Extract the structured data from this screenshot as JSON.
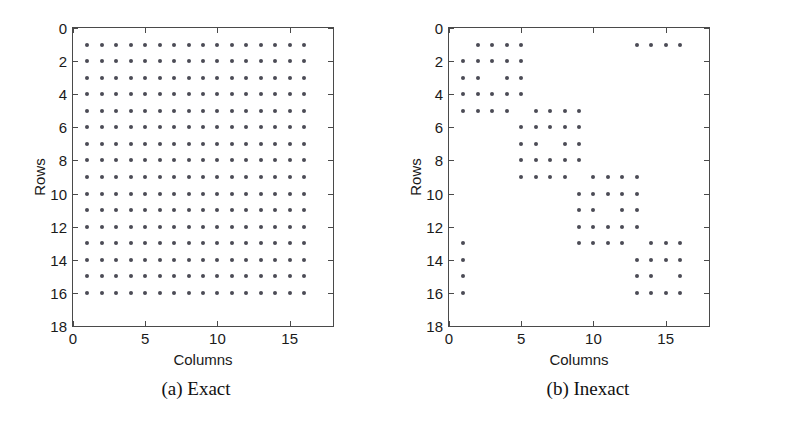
{
  "figure": {
    "background": "#ffffff",
    "dot_color": "#4b4b55",
    "axis_color": "#4a4a4a"
  },
  "panels": [
    {
      "id": "exact",
      "caption": "(a) Exact",
      "xlabel": "Columns",
      "ylabel": "Rows",
      "xticks": [
        "0",
        "5",
        "10",
        "15"
      ],
      "xtick_values": [
        0,
        5,
        10,
        15
      ],
      "yticks": [
        "0",
        "2",
        "4",
        "6",
        "8",
        "10",
        "12",
        "14",
        "16",
        "18"
      ],
      "ytick_values": [
        0,
        2,
        4,
        6,
        8,
        10,
        12,
        14,
        16,
        18
      ]
    },
    {
      "id": "inexact",
      "caption": "(b) Inexact",
      "xlabel": "Columns",
      "ylabel": "Rows",
      "xticks": [
        "0",
        "5",
        "10",
        "15"
      ],
      "xtick_values": [
        0,
        5,
        10,
        15
      ],
      "yticks": [
        "0",
        "2",
        "4",
        "6",
        "8",
        "10",
        "12",
        "14",
        "16",
        "18"
      ],
      "ytick_values": [
        0,
        2,
        4,
        6,
        8,
        10,
        12,
        14,
        16,
        18
      ]
    }
  ],
  "chart_data": [
    {
      "type": "scatter",
      "title": "(a) Exact",
      "xlabel": "Columns",
      "ylabel": "Rows",
      "xlim": [
        0,
        18
      ],
      "ylim": [
        18,
        0
      ],
      "y_inverted": true,
      "grid": false,
      "legend": null,
      "marker": "dot",
      "description": "Dense sparsity pattern: every entry of a 16x16 matrix is nonzero.",
      "points": [
        {
          "col": 1,
          "rows": [
            1,
            2,
            3,
            4,
            5,
            6,
            7,
            8,
            9,
            10,
            11,
            12,
            13,
            14,
            15,
            16
          ]
        },
        {
          "col": 2,
          "rows": [
            1,
            2,
            3,
            4,
            5,
            6,
            7,
            8,
            9,
            10,
            11,
            12,
            13,
            14,
            15,
            16
          ]
        },
        {
          "col": 3,
          "rows": [
            1,
            2,
            3,
            4,
            5,
            6,
            7,
            8,
            9,
            10,
            11,
            12,
            13,
            14,
            15,
            16
          ]
        },
        {
          "col": 4,
          "rows": [
            1,
            2,
            3,
            4,
            5,
            6,
            7,
            8,
            9,
            10,
            11,
            12,
            13,
            14,
            15,
            16
          ]
        },
        {
          "col": 5,
          "rows": [
            1,
            2,
            3,
            4,
            5,
            6,
            7,
            8,
            9,
            10,
            11,
            12,
            13,
            14,
            15,
            16
          ]
        },
        {
          "col": 6,
          "rows": [
            1,
            2,
            3,
            4,
            5,
            6,
            7,
            8,
            9,
            10,
            11,
            12,
            13,
            14,
            15,
            16
          ]
        },
        {
          "col": 7,
          "rows": [
            1,
            2,
            3,
            4,
            5,
            6,
            7,
            8,
            9,
            10,
            11,
            12,
            13,
            14,
            15,
            16
          ]
        },
        {
          "col": 8,
          "rows": [
            1,
            2,
            3,
            4,
            5,
            6,
            7,
            8,
            9,
            10,
            11,
            12,
            13,
            14,
            15,
            16
          ]
        },
        {
          "col": 9,
          "rows": [
            1,
            2,
            3,
            4,
            5,
            6,
            7,
            8,
            9,
            10,
            11,
            12,
            13,
            14,
            15,
            16
          ]
        },
        {
          "col": 10,
          "rows": [
            1,
            2,
            3,
            4,
            5,
            6,
            7,
            8,
            9,
            10,
            11,
            12,
            13,
            14,
            15,
            16
          ]
        },
        {
          "col": 11,
          "rows": [
            1,
            2,
            3,
            4,
            5,
            6,
            7,
            8,
            9,
            10,
            11,
            12,
            13,
            14,
            15,
            16
          ]
        },
        {
          "col": 12,
          "rows": [
            1,
            2,
            3,
            4,
            5,
            6,
            7,
            8,
            9,
            10,
            11,
            12,
            13,
            14,
            15,
            16
          ]
        },
        {
          "col": 13,
          "rows": [
            1,
            2,
            3,
            4,
            5,
            6,
            7,
            8,
            9,
            10,
            11,
            12,
            13,
            14,
            15,
            16
          ]
        },
        {
          "col": 14,
          "rows": [
            1,
            2,
            3,
            4,
            5,
            6,
            7,
            8,
            9,
            10,
            11,
            12,
            13,
            14,
            15,
            16
          ]
        },
        {
          "col": 15,
          "rows": [
            1,
            2,
            3,
            4,
            5,
            6,
            7,
            8,
            9,
            10,
            11,
            12,
            13,
            14,
            15,
            16
          ]
        },
        {
          "col": 16,
          "rows": [
            1,
            2,
            3,
            4,
            5,
            6,
            7,
            8,
            9,
            10,
            11,
            12,
            13,
            14,
            15,
            16
          ]
        }
      ],
      "nonzero_count": 256
    },
    {
      "type": "scatter",
      "title": "(b) Inexact",
      "xlabel": "Columns",
      "ylabel": "Rows",
      "xlim": [
        0,
        18
      ],
      "ylim": [
        18,
        0
      ],
      "y_inverted": true,
      "grid": false,
      "legend": null,
      "marker": "dot",
      "description": "Sparse block-diagonal pattern with cyclic corner coupling: four overlapping diagonal blocks plus row-1/column-1 wrap-around entries.",
      "points": [
        {
          "row": 1,
          "cols": [
            2,
            3,
            4,
            5,
            13,
            14,
            15,
            16
          ]
        },
        {
          "row": 2,
          "cols": [
            1,
            2,
            3,
            4,
            5
          ]
        },
        {
          "row": 3,
          "cols": [
            1,
            2,
            4,
            5
          ]
        },
        {
          "row": 4,
          "cols": [
            1,
            2,
            3,
            4,
            5
          ]
        },
        {
          "row": 5,
          "cols": [
            1,
            2,
            3,
            4,
            6,
            7,
            8,
            9
          ]
        },
        {
          "row": 6,
          "cols": [
            5,
            6,
            7,
            8,
            9
          ]
        },
        {
          "row": 7,
          "cols": [
            5,
            6,
            8,
            9
          ]
        },
        {
          "row": 8,
          "cols": [
            5,
            6,
            7,
            8,
            9
          ]
        },
        {
          "row": 9,
          "cols": [
            5,
            6,
            7,
            8,
            10,
            11,
            12,
            13
          ]
        },
        {
          "row": 10,
          "cols": [
            9,
            10,
            11,
            12,
            13
          ]
        },
        {
          "row": 11,
          "cols": [
            9,
            10,
            12,
            13
          ]
        },
        {
          "row": 12,
          "cols": [
            9,
            10,
            11,
            12,
            13
          ]
        },
        {
          "row": 13,
          "cols": [
            1,
            9,
            10,
            11,
            12,
            14,
            15,
            16
          ]
        },
        {
          "row": 14,
          "cols": [
            1,
            13,
            14,
            15,
            16
          ]
        },
        {
          "row": 15,
          "cols": [
            1,
            13,
            14,
            16
          ]
        },
        {
          "row": 16,
          "cols": [
            1,
            13,
            14,
            15,
            16
          ]
        }
      ],
      "nonzero_count": 84
    }
  ]
}
